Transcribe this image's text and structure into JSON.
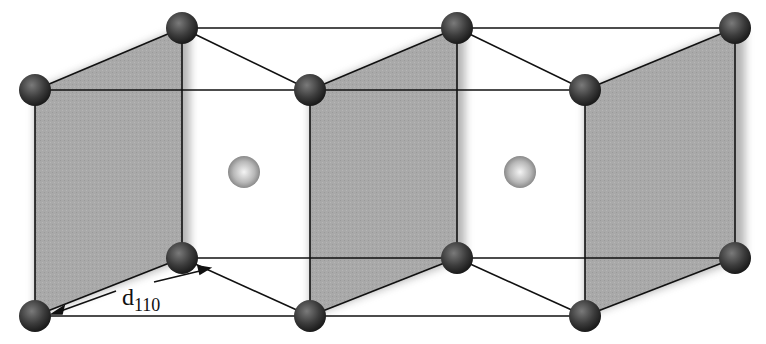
{
  "diagram": {
    "title": "",
    "colors": {
      "plane_fill": "#a8a8a8",
      "edge": "#111111",
      "corner_atom": "#3a3a3a",
      "center_atom": "#bdbdbd",
      "background": "#ffffff"
    },
    "corner_atoms": [
      {
        "x": 182,
        "y": 28
      },
      {
        "x": 457,
        "y": 28
      },
      {
        "x": 735,
        "y": 28
      },
      {
        "x": 35,
        "y": 90
      },
      {
        "x": 310,
        "y": 90
      },
      {
        "x": 585,
        "y": 90
      },
      {
        "x": 182,
        "y": 258
      },
      {
        "x": 457,
        "y": 258
      },
      {
        "x": 735,
        "y": 258
      },
      {
        "x": 35,
        "y": 316
      },
      {
        "x": 310,
        "y": 316
      },
      {
        "x": 585,
        "y": 316
      }
    ],
    "center_atoms": [
      {
        "x": 244,
        "y": 172
      },
      {
        "x": 520,
        "y": 172
      }
    ],
    "shaded_planes": 3,
    "annotation": {
      "symbol": "d",
      "subscript": "110",
      "meaning": "interplanar spacing between (110) planes"
    }
  }
}
